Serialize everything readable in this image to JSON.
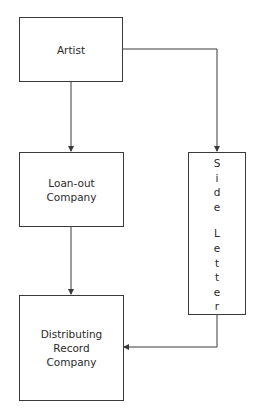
{
  "diagram": {
    "nodes": {
      "artist": {
        "label": "Artist"
      },
      "loan_out": {
        "label": "Loan-out\nCompany"
      },
      "distributing": {
        "label": "Distributing\nRecord\nCompany"
      },
      "side_letter": {
        "label": "Side Letter",
        "chars": [
          "S",
          "i",
          "d",
          "e",
          " ",
          "L",
          "e",
          "t",
          "t",
          "e",
          "r"
        ]
      }
    },
    "edges": [
      {
        "from": "Artist",
        "to": "Loan-out Company"
      },
      {
        "from": "Loan-out Company",
        "to": "Distributing Record Company"
      },
      {
        "from": "Artist",
        "to": "Side Letter"
      },
      {
        "from": "Side Letter",
        "to": "Distributing Record Company"
      }
    ],
    "colors": {
      "line": "#3a3a3a",
      "background": "#ffffff"
    }
  }
}
